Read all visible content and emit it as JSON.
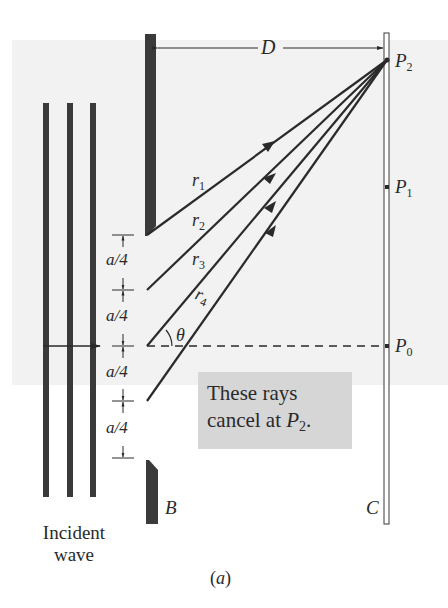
{
  "figure": {
    "caption": "(a)",
    "distance_label": "D",
    "barrier_label": "B",
    "screen_label": "C",
    "incident_label_line1": "Incident",
    "incident_label_line2": "wave",
    "angle_label": "θ",
    "spacing_label": "a/4",
    "spacings": [
      "a/4",
      "a/4",
      "a/4",
      "a/4"
    ],
    "points": [
      {
        "name": "P",
        "sub": "2"
      },
      {
        "name": "P",
        "sub": "1"
      },
      {
        "name": "P",
        "sub": "0"
      }
    ],
    "rays": [
      {
        "name": "r",
        "sub": "1"
      },
      {
        "name": "r",
        "sub": "2"
      },
      {
        "name": "r",
        "sub": "3"
      },
      {
        "name": "r",
        "sub": "4"
      }
    ],
    "callout": {
      "line1": "These rays",
      "line2_prefix": "cancel at ",
      "point": "P",
      "point_sub": "2",
      "suffix": "."
    },
    "colors": {
      "ink": "#2a2a2a",
      "barrier": "#3a3a3a",
      "panel": "#f2f2f2",
      "callout_bg": "#d6d6d6"
    }
  }
}
